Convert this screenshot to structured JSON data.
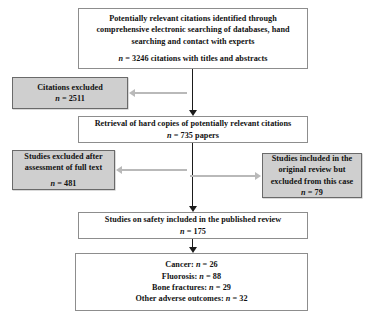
{
  "diagram": {
    "colors": {
      "box_border": "#8d8d8d",
      "excluded_fill": "#cfcfcf",
      "arrow_vertical": "#1b1b1b",
      "arrow_horizontal": "#b9b9b9"
    },
    "nodes": {
      "identification": {
        "lines": [
          "Potentially relevant citations identified through",
          "comprehensive electronic searching of databases, hand",
          "searching and contact with experts"
        ],
        "count_line": "n = 3246 citations with titles and abstracts",
        "n_symbol": "n",
        "n_value": 3246
      },
      "citations_excluded": {
        "lines": [
          "Citations excluded"
        ],
        "count_line": "n = 2511",
        "n_value": 2511
      },
      "retrieval": {
        "lines": [
          "Retrieval of hard copies of potentially relevant citations"
        ],
        "count_line": "n = 735 papers",
        "n_value": 735
      },
      "studies_excluded_fulltext": {
        "lines": [
          "Studies excluded after",
          "assessment of full text"
        ],
        "count_line": "n = 481",
        "n_value": 481
      },
      "original_review_excluded": {
        "lines": [
          "Studies included in the",
          "original review but",
          "excluded from this case"
        ],
        "count_line": "n = 79",
        "n_value": 79
      },
      "studies_safety": {
        "lines": [
          "Studies on safety included in the published review"
        ],
        "count_line": "n = 175",
        "n_value": 175
      },
      "outcomes": {
        "items": [
          "Cancer: n = 26",
          "Fluorosis: n = 88",
          "Bone fractures: n = 29",
          "Other adverse outcomes: n = 32"
        ],
        "values": {
          "cancer": 26,
          "fluorosis": 88,
          "bone_fractures": 29,
          "other_adverse_outcomes": 32
        }
      }
    }
  }
}
